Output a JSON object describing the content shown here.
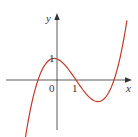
{
  "chart_data": {
    "type": "line",
    "title": "",
    "xlabel": "x",
    "ylabel": "y",
    "x_ticks": [
      {
        "value": 0,
        "label": "0"
      },
      {
        "value": 1,
        "label": "1"
      }
    ],
    "y_ticks": [
      {
        "value": 1,
        "label": "1"
      }
    ],
    "grid": false,
    "legend": null,
    "series": [
      {
        "name": "cubic curve",
        "color": "#c0392b",
        "description": "cubic with roots near x=-1, 1, 3; local max at (0,1); local min near (2.15,-1.05)",
        "x": [
          -1.9,
          -1.5,
          -1,
          -0.5,
          0,
          0.5,
          1,
          1.5,
          2,
          2.15,
          2.5,
          3,
          3.5,
          3.7
        ],
        "y": [
          -2.4,
          -1.875,
          0,
          0.875,
          1,
          0.625,
          0,
          -0.625,
          -1,
          -1.05,
          -0.875,
          0,
          1.625,
          2.7
        ]
      }
    ],
    "xlim": [
      -2.7,
      3.9
    ],
    "ylim": [
      -2.35,
      3.1
    ]
  },
  "labels": {
    "x_axis": "x",
    "y_axis": "y",
    "origin": "0",
    "x_one": "1",
    "y_one": "1"
  },
  "colors": {
    "axis": "#333333",
    "curve": "#c0392b"
  }
}
